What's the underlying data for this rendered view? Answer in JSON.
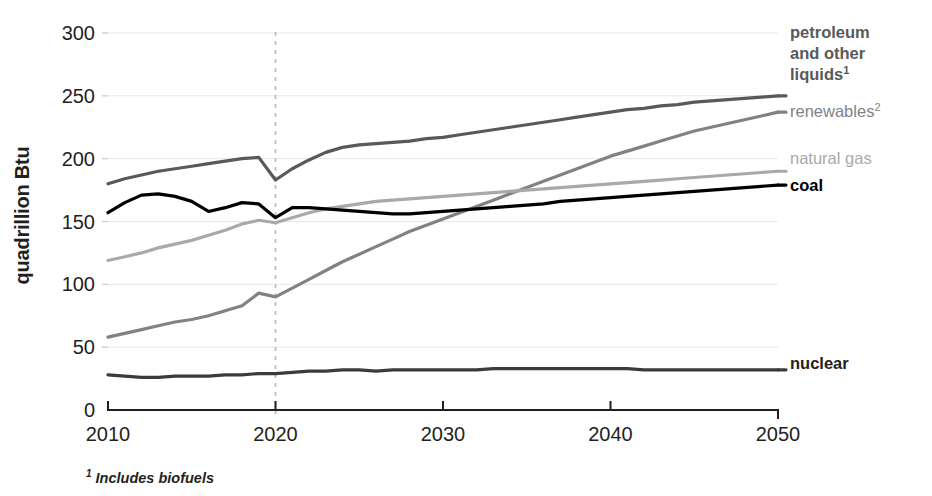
{
  "chart_data": {
    "type": "line",
    "title": "",
    "subtitle": "",
    "xlabel": "",
    "ylabel": "quadrillion Btu",
    "xlim": [
      2010,
      2050
    ],
    "ylim": [
      0,
      300
    ],
    "grid": true,
    "legend_position": "right-inline",
    "x_ticks": [
      "2010",
      "2020",
      "2030",
      "2040",
      "2050"
    ],
    "y_ticks": [
      "0",
      "50",
      "100",
      "150",
      "200",
      "250",
      "300"
    ],
    "x": [
      2010,
      2011,
      2012,
      2013,
      2014,
      2015,
      2016,
      2017,
      2018,
      2019,
      2020,
      2021,
      2022,
      2023,
      2024,
      2025,
      2026,
      2027,
      2028,
      2029,
      2030,
      2031,
      2032,
      2033,
      2034,
      2035,
      2036,
      2037,
      2038,
      2039,
      2040,
      2041,
      2042,
      2043,
      2044,
      2045,
      2046,
      2047,
      2048,
      2049,
      2050
    ],
    "annotations": {
      "projection_divider_year": 2020,
      "divider_style": "dashed"
    },
    "footnotes": [
      "¹ Includes biofuels"
    ],
    "series": [
      {
        "name": "petroleum and other liquids",
        "label": "petroleum and other liquids",
        "superscript": "1",
        "color": "#58595b",
        "values": [
          180,
          184,
          187,
          190,
          192,
          194,
          196,
          198,
          200,
          201,
          183,
          192,
          199,
          205,
          209,
          211,
          212,
          213,
          214,
          216,
          217,
          219,
          221,
          223,
          225,
          227,
          229,
          231,
          233,
          235,
          237,
          239,
          240,
          242,
          243,
          245,
          246,
          247,
          248,
          249,
          250
        ]
      },
      {
        "name": "renewables",
        "label": "renewables",
        "superscript": "2",
        "color": "#808285",
        "values": [
          58,
          61,
          64,
          67,
          70,
          72,
          75,
          79,
          83,
          93,
          90,
          97,
          104,
          111,
          118,
          124,
          130,
          136,
          142,
          147,
          152,
          157,
          162,
          167,
          172,
          177,
          182,
          187,
          192,
          197,
          202,
          206,
          210,
          214,
          218,
          222,
          225,
          228,
          231,
          234,
          237
        ]
      },
      {
        "name": "natural gas",
        "label": "natural gas",
        "superscript": "",
        "color": "#a7a9ac",
        "values": [
          119,
          122,
          125,
          129,
          132,
          135,
          139,
          143,
          148,
          151,
          149,
          153,
          157,
          160,
          162,
          164,
          166,
          167,
          168,
          169,
          170,
          171,
          172,
          173,
          174,
          175,
          176,
          177,
          178,
          179,
          180,
          181,
          182,
          183,
          184,
          185,
          186,
          187,
          188,
          189,
          190
        ]
      },
      {
        "name": "coal",
        "label": "coal",
        "superscript": "",
        "color": "#000000",
        "values": [
          157,
          165,
          171,
          172,
          170,
          166,
          158,
          161,
          165,
          164,
          153,
          161,
          161,
          160,
          159,
          158,
          157,
          156,
          156,
          157,
          158,
          159,
          160,
          161,
          162,
          163,
          164,
          166,
          167,
          168,
          169,
          170,
          171,
          172,
          173,
          174,
          175,
          176,
          177,
          178,
          179
        ]
      },
      {
        "name": "nuclear",
        "label": "nuclear",
        "superscript": "",
        "color": "#3b3b3b",
        "values": [
          28,
          27,
          26,
          26,
          27,
          27,
          27,
          28,
          28,
          29,
          29,
          30,
          31,
          31,
          32,
          32,
          31,
          32,
          32,
          32,
          32,
          32,
          32,
          33,
          33,
          33,
          33,
          33,
          33,
          33,
          33,
          33,
          32,
          32,
          32,
          32,
          32,
          32,
          32,
          32,
          32
        ]
      }
    ]
  },
  "axes": {
    "y_label": "quadrillion Btu"
  },
  "labels": {
    "petroleum_line1": "petroleum",
    "petroleum_line2": "and other",
    "petroleum_line3": "liquids",
    "petroleum_sup": "1",
    "renewables": "renewables",
    "renewables_sup": "2",
    "natural_gas": "natural gas",
    "coal": "coal",
    "nuclear": "nuclear"
  },
  "footnote": {
    "marker": "1",
    "text": "Includes biofuels"
  }
}
